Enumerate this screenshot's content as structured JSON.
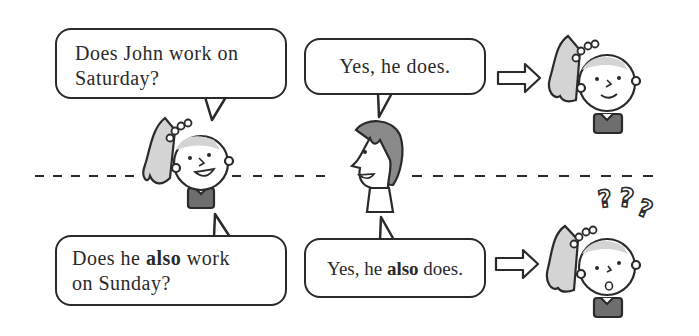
{
  "scene": {
    "top_row": {
      "question_bubble": {
        "line1": "Does John work on",
        "line2": "Saturday?"
      },
      "answer_bubble": {
        "text": "Yes, he does."
      },
      "result": "girl-smiling"
    },
    "bottom_row": {
      "question_bubble": {
        "line1_pre": "Does he ",
        "line1_bold": "also",
        "line1_post": " work",
        "line2": "on Sunday?"
      },
      "answer_bubble": {
        "pre": "Yes, he ",
        "bold": "also",
        "post": " does."
      },
      "result": "girl-confused",
      "question_marks": [
        "?",
        "?",
        "?"
      ]
    },
    "divider": "dashed-line",
    "colors": {
      "ink": "#2a2a2a",
      "girl_hair": "#d4d4d4",
      "boy_hair": "#8a8a8a",
      "shirt": "#6e6e6e"
    }
  }
}
